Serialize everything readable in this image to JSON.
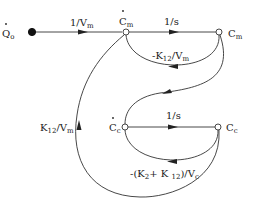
{
  "diagram": {
    "type": "signal-flow-graph",
    "nodes": [
      {
        "id": "Qo_dot",
        "label": "Q",
        "sub": "o",
        "dot": true,
        "filled": true
      },
      {
        "id": "Cm_dot",
        "label": "C",
        "sub": "m",
        "dot": true
      },
      {
        "id": "Cm",
        "label": "C",
        "sub": "m",
        "dot": false
      },
      {
        "id": "Cc_dot",
        "label": "C",
        "sub": "c",
        "dot": true
      },
      {
        "id": "Cc",
        "label": "C",
        "sub": "c",
        "dot": false
      }
    ],
    "edges": [
      {
        "from": "Qo_dot",
        "to": "Cm_dot",
        "gain": "1/V",
        "gain_sub": "m"
      },
      {
        "from": "Cm_dot",
        "to": "Cm",
        "gain": "1/s"
      },
      {
        "from": "Cm",
        "to": "Cm_dot",
        "gain": "-K",
        "gain_sub": "12",
        "gain_tail": "/V",
        "gain_tail_sub": "m"
      },
      {
        "from": "Cm",
        "to": "Cc_dot",
        "gain": ""
      },
      {
        "from": "Cc_dot",
        "to": "Cc",
        "gain": "1/s"
      },
      {
        "from": "Cc",
        "to": "Cc_dot",
        "gain": "-(K",
        "gain_sub": "2",
        "gain_mid": "+ K ",
        "gain_mid_sub": "12",
        "gain_tail": ")/V",
        "gain_tail_sub": "c"
      },
      {
        "from": "Cc",
        "to": "Cm_dot",
        "gain": "K",
        "gain_sub": "12",
        "gain_tail": "/V",
        "gain_tail_sub": "m"
      }
    ]
  }
}
